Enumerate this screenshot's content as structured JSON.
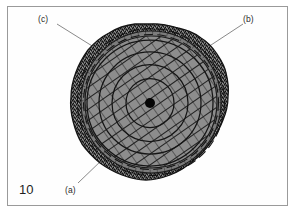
{
  "figure": {
    "number": "10",
    "caption_labels": [
      {
        "id": "a",
        "text": "(a)",
        "position": "bottom-left"
      },
      {
        "id": "b",
        "text": "(b)",
        "position": "top-right"
      },
      {
        "id": "c",
        "text": "(c)",
        "position": "top-left"
      }
    ],
    "colors": {
      "frame_border": "#9a9a9a",
      "page_background": "#ffffff",
      "body_fill": "#8d8d8d",
      "outer_band_fill": "#4a4a4a",
      "inner_ring_fill": "#7f7f7f",
      "hatch_stroke": "#2a2a2a",
      "outline_stroke": "#1c1c1c",
      "center_dot": "#050505",
      "leader_line": "#777777"
    },
    "geometry": {
      "center_x": 151,
      "center_y": 102,
      "outer_radius_x": 77,
      "outer_radius_y": 78,
      "band_thickness": 9,
      "center_dot_radius": 5,
      "concentric_ring_radii": [
        24,
        38,
        52,
        63
      ],
      "hatch_angle_degrees": 35,
      "hatch_spacing": 9,
      "dashed_segment_count": 26
    },
    "leaders": [
      {
        "id": "c",
        "x1": 57,
        "y1": 23,
        "x2": 96,
        "y2": 48
      },
      {
        "id": "b",
        "x1": 241,
        "y1": 23,
        "x2": 209,
        "y2": 46
      },
      {
        "id": "a",
        "x1": 77,
        "y1": 184,
        "x2": 103,
        "y2": 159
      }
    ]
  }
}
